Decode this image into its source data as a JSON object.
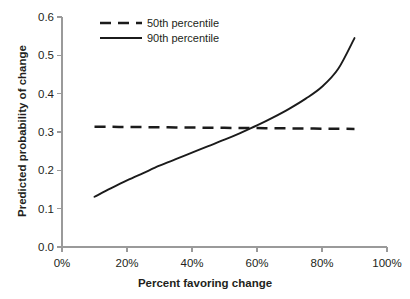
{
  "chart_data": {
    "type": "line",
    "title": "",
    "xlabel": "Percent favoring change",
    "ylabel": "Predicted probability of change",
    "xlim": [
      0,
      100
    ],
    "ylim": [
      0.0,
      0.6
    ],
    "grid": false,
    "legend_position": "top-left-inside",
    "x_tick_labels": [
      "0%",
      "20%",
      "40%",
      "60%",
      "80%",
      "100%"
    ],
    "x_ticks": [
      0,
      20,
      40,
      60,
      80,
      100
    ],
    "y_tick_labels": [
      "0.0",
      "0.1",
      "0.2",
      "0.3",
      "0.4",
      "0.5",
      "0.6"
    ],
    "y_ticks": [
      0.0,
      0.1,
      0.2,
      0.3,
      0.4,
      0.5,
      0.6
    ],
    "x": [
      10,
      15,
      20,
      25,
      30,
      35,
      40,
      45,
      50,
      55,
      60,
      65,
      70,
      75,
      80,
      85,
      90
    ],
    "series": [
      {
        "name": "50th percentile",
        "style": "dashed",
        "color": "#1b1b1b",
        "values": [
          0.314,
          0.3135,
          0.313,
          0.3127,
          0.3123,
          0.312,
          0.3116,
          0.3113,
          0.3109,
          0.3105,
          0.3102,
          0.3098,
          0.3095,
          0.3091,
          0.3088,
          0.3084,
          0.308
        ]
      },
      {
        "name": "90th percentile",
        "style": "solid",
        "color": "#1b1b1b",
        "values": [
          0.131,
          0.153,
          0.174,
          0.193,
          0.212,
          0.229,
          0.246,
          0.263,
          0.28,
          0.298,
          0.317,
          0.338,
          0.361,
          0.387,
          0.418,
          0.465,
          0.545
        ]
      }
    ],
    "annotations": {
      "crossover_x_percent": 54,
      "crossover_y": 0.311
    }
  },
  "legend": {
    "items": [
      {
        "label": "50th percentile",
        "style": "dashed"
      },
      {
        "label": "90th percentile",
        "style": "solid"
      }
    ]
  },
  "colors": {
    "background": "#ffffff",
    "axis": "#9a9a9a",
    "line": "#1b1b1b",
    "text": "#231f20"
  }
}
